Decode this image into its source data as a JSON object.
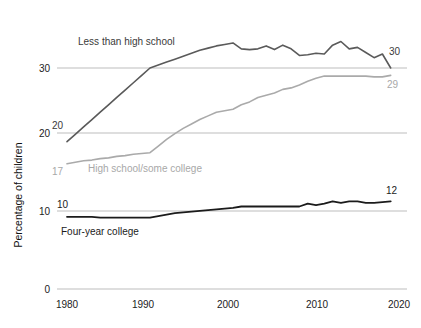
{
  "chart_data": {
    "type": "line",
    "title": "",
    "xlabel": "",
    "ylabel": "Percentage of children",
    "xlim": [
      1980,
      2020
    ],
    "ylim": [
      0,
      35
    ],
    "yticks": [
      0,
      10,
      20,
      30
    ],
    "ytick_labels": [
      "0",
      "10",
      "20",
      "30"
    ],
    "xticks": [
      1980,
      1990,
      2000,
      2010,
      2020
    ],
    "xtick_labels": [
      "1980",
      "1990",
      "2000",
      "2010",
      "2020"
    ],
    "grid": "horizontal",
    "legend": "inline-annotations",
    "series": [
      {
        "name": "Less than high school",
        "color": "#5a5a5a",
        "start_label": "20",
        "end_label": "30",
        "label_text": "Less than high school",
        "x": [
          1980,
          1981,
          1982,
          1983,
          1984,
          1985,
          1986,
          1987,
          1988,
          1989,
          1990,
          1991,
          1992,
          1993,
          1994,
          1995,
          1996,
          1997,
          1998,
          1999,
          2000,
          2001,
          2002,
          2003,
          2004,
          2005,
          2006,
          2007,
          2008,
          2009,
          2010,
          2011,
          2012,
          2013,
          2014,
          2015,
          2016,
          2017,
          2018,
          2019
        ],
        "values": [
          20.0,
          21.0,
          22.0,
          23.0,
          24.0,
          25.0,
          26.0,
          27.0,
          28.0,
          29.0,
          30.0,
          30.4,
          30.8,
          31.2,
          31.6,
          32.0,
          32.4,
          32.7,
          33.0,
          33.2,
          33.4,
          32.6,
          32.5,
          32.6,
          33.0,
          32.5,
          33.1,
          32.6,
          31.7,
          31.8,
          32.0,
          31.9,
          33.1,
          33.6,
          32.6,
          32.8,
          32.1,
          31.4,
          31.9,
          30.0
        ]
      },
      {
        "name": "High school/some college",
        "color": "#aaaaaa",
        "start_label": "17",
        "end_label": "29",
        "label_text": "High school/some college",
        "x": [
          1980,
          1981,
          1982,
          1983,
          1984,
          1985,
          1986,
          1987,
          1988,
          1989,
          1990,
          1991,
          1992,
          1993,
          1994,
          1995,
          1996,
          1997,
          1998,
          1999,
          2000,
          2001,
          2002,
          2003,
          2004,
          2005,
          2006,
          2007,
          2008,
          2009,
          2010,
          2011,
          2012,
          2013,
          2014,
          2015,
          2016,
          2017,
          2018,
          2019
        ],
        "values": [
          17.0,
          17.2,
          17.4,
          17.5,
          17.7,
          17.8,
          18.0,
          18.1,
          18.3,
          18.4,
          18.5,
          19.4,
          20.3,
          21.1,
          21.8,
          22.4,
          23.0,
          23.5,
          24.0,
          24.2,
          24.4,
          25.0,
          25.4,
          26.0,
          26.3,
          26.6,
          27.1,
          27.3,
          27.7,
          28.2,
          28.6,
          28.9,
          28.9,
          28.9,
          28.9,
          28.9,
          28.9,
          28.8,
          28.8,
          29.0
        ]
      },
      {
        "name": "Four-year college",
        "color": "#1b1b1b",
        "start_label": "10",
        "end_label": "12",
        "label_text": "Four-year college",
        "x": [
          1980,
          1981,
          1982,
          1983,
          1984,
          1985,
          1986,
          1987,
          1988,
          1989,
          1990,
          1991,
          1992,
          1993,
          1994,
          1995,
          1996,
          1997,
          1998,
          1999,
          2000,
          2001,
          2002,
          2003,
          2004,
          2005,
          2006,
          2007,
          2008,
          2009,
          2010,
          2011,
          2012,
          2013,
          2014,
          2015,
          2016,
          2017,
          2018,
          2019
        ],
        "values": [
          9.8,
          9.8,
          9.8,
          9.8,
          9.7,
          9.7,
          9.7,
          9.7,
          9.7,
          9.7,
          9.7,
          9.9,
          10.1,
          10.3,
          10.4,
          10.5,
          10.6,
          10.7,
          10.8,
          10.9,
          11.0,
          11.2,
          11.2,
          11.2,
          11.2,
          11.2,
          11.2,
          11.2,
          11.2,
          11.6,
          11.4,
          11.6,
          11.9,
          11.7,
          11.9,
          11.9,
          11.7,
          11.7,
          11.8,
          11.9
        ]
      }
    ]
  },
  "annotations": {
    "less_than_hs_label": "Less than high school",
    "hs_some_college_label": "High school/some college",
    "four_year_label": "Four-year college",
    "start_20": "20",
    "start_17": "17",
    "start_10": "10",
    "end_30": "30",
    "end_29": "29",
    "end_12": "12"
  },
  "axes": {
    "y_title": "Percentage of children",
    "y_ticks": [
      "30",
      "20",
      "10",
      "0"
    ],
    "x_ticks": [
      "1980",
      "1990",
      "2000",
      "2010",
      "2020"
    ]
  },
  "colors": {
    "less_than_high_school": "#5a5a5a",
    "high_school_some_college": "#aaaaaa",
    "four_year_college": "#1b1b1b",
    "gridline": "#bdbdbd",
    "background": "#ffffff"
  }
}
